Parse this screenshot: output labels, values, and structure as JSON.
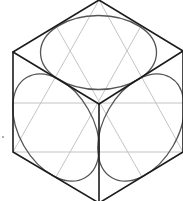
{
  "diagram": {
    "type": "isometric-cube-with-inscribed-ellipses",
    "colors": {
      "background": "#ffffff",
      "edge": "#1c1c1c",
      "ellipse": "#555555",
      "guide": "#bdbdbd"
    },
    "cube": {
      "vertices": {
        "top": [
          99,
          0
        ],
        "upper_left": [
          13,
          52
        ],
        "upper_right": [
          183,
          51
        ],
        "center": [
          99,
          104
        ],
        "lower_left": [
          13,
          152
        ],
        "lower_right": [
          183,
          152
        ],
        "bottom": [
          99,
          203
        ]
      }
    },
    "ellipses": [
      {
        "face": "top",
        "cx": 98.5,
        "cy": 52.5,
        "rx": 58,
        "ry": 37,
        "rotate": 0
      },
      {
        "face": "left",
        "cx": 56,
        "cy": 127.5,
        "rx": 58,
        "ry": 37,
        "rotate": 60
      },
      {
        "face": "right",
        "cx": 141,
        "cy": 127.5,
        "rx": 58,
        "ry": 37,
        "rotate": -60
      }
    ],
    "guide_lines": [
      {
        "from": [
          13,
          103
        ],
        "to": [
          183,
          103
        ]
      },
      {
        "from": [
          13,
          152
        ],
        "to": [
          183,
          152
        ]
      },
      {
        "from": [
          99,
          0
        ],
        "to": [
          13,
          152
        ]
      },
      {
        "from": [
          99,
          0
        ],
        "to": [
          183,
          152
        ]
      },
      {
        "from": [
          56,
          26
        ],
        "to": [
          142,
          177
        ]
      },
      {
        "from": [
          141,
          26
        ],
        "to": [
          56,
          177
        ]
      }
    ],
    "stray_mark": {
      "x": 3,
      "y": 137
    }
  }
}
